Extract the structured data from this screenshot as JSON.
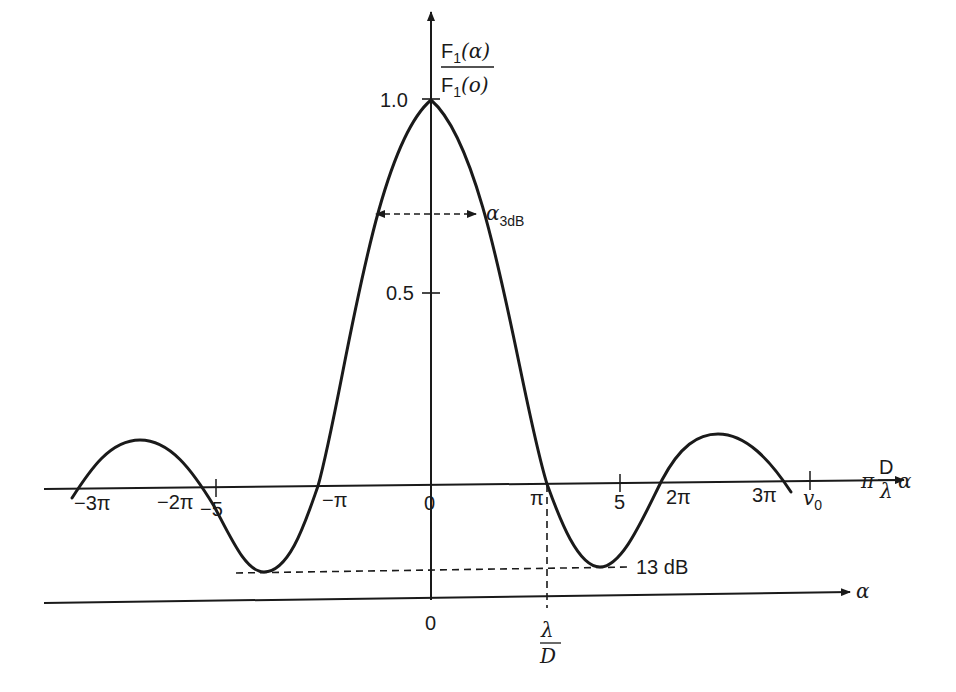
{
  "diagram": {
    "colors": {
      "ink": "#1a1a1a",
      "background": "#ffffff"
    },
    "y_axis": {
      "label_numerator": "F",
      "label_numerator_sub": "1",
      "label_numerator_arg": "(α)",
      "label_denominator": "F",
      "label_denominator_sub": "1",
      "label_denominator_arg": "(o)",
      "ticks": [
        {
          "label": "1.0",
          "value": 1.0
        },
        {
          "label": "0.5",
          "value": 0.5
        }
      ]
    },
    "upper_x_axis": {
      "label_prefix": "π",
      "label_frac_num": "D",
      "label_frac_den": "λ",
      "label_suffix": "α",
      "tick_labels": {
        "m3pi": "−3π",
        "m2pi": "−2π",
        "m5": "−5",
        "mpi": "−π",
        "zero": "0",
        "pi": "π",
        "five": "5",
        "twopi": "2π",
        "threepi": "3π",
        "v0": "v",
        "v0_sub": "0"
      }
    },
    "lower_x_axis": {
      "label": "α",
      "tick_zero": "0",
      "tick_frac_num": "λ",
      "tick_frac_den": "D"
    },
    "annotations": {
      "beamwidth_label": "α",
      "beamwidth_sub": "3dB",
      "sidelobe_label": "13 dB"
    },
    "curve": {
      "description": "Normalized far-field pattern F1(α)/F1(0) of uniform aperture (sinc-like), main lobe peak 1.0 at 0, zeros at ±π, ±2π, ±3π, first sidelobe level −13 dB"
    }
  }
}
